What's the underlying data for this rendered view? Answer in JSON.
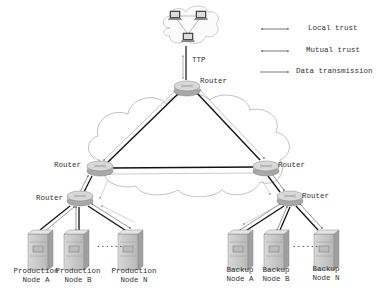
{
  "legend": {
    "items": [
      {
        "label": "Local trust",
        "style": "double-arrow-short"
      },
      {
        "label": "Mutual trust",
        "style": "double-arrow"
      },
      {
        "label": "Data transmission",
        "style": "single-arrow"
      }
    ]
  },
  "ttp": {
    "label": "TTP",
    "icon": "computer-cloud-icon"
  },
  "routers": {
    "top": "Router",
    "left": "Router",
    "right": "Router",
    "left_lower": "Router",
    "right_lower": "Router"
  },
  "production_nodes": [
    {
      "line1": "Production",
      "line2": "Node A"
    },
    {
      "line1": "Production",
      "line2": "Node B"
    },
    {
      "line1": "Production",
      "line2": "Node N"
    }
  ],
  "backup_nodes": [
    {
      "line1": "Backup",
      "line2": "Node A"
    },
    {
      "line1": "Backup",
      "line2": "Node B"
    },
    {
      "line1": "Backup",
      "line2": "Node N"
    }
  ],
  "ellipsis": "......",
  "colors": {
    "line": "#1a1a1a",
    "light_line": "#9a9a9a",
    "router": "#bdbdbd",
    "server": "#c8c8c8"
  }
}
